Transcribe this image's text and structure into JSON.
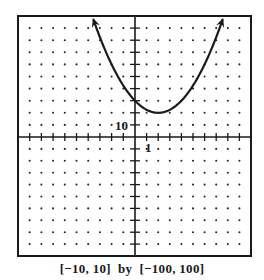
{
  "chart_data": {
    "type": "line",
    "title": "",
    "function": "y = 2.5(x - 2)^2 + 20",
    "xlim": [
      -10,
      10
    ],
    "ylim": [
      -100,
      100
    ],
    "xscl": 1,
    "yscl": 10,
    "grid": "dots",
    "x_tick_label": "1",
    "y_tick_label": "10",
    "caption": "[−10, 10] by [−100, 100]",
    "series": [
      {
        "name": "parabola",
        "x": [
          -3.54,
          -3,
          -2,
          -1,
          0,
          1,
          2,
          3,
          4,
          5,
          6,
          7,
          7.54
        ],
        "values": [
          96.7,
          82.5,
          60,
          42.5,
          30,
          22.5,
          20,
          22.5,
          30,
          42.5,
          60,
          82.5,
          96.7
        ],
        "arrows": "both ends",
        "vertex": [
          2,
          20
        ],
        "y_intercept": 30
      }
    ],
    "colors": {
      "line": "#1a1a1a",
      "frame": "#1a1a1a",
      "dots": "#2a2a2a",
      "background": "#ffffff"
    }
  },
  "labels": {
    "x_tick": "1",
    "y_tick": "10",
    "caption": "[−10, 10]  by  [−100, 100]"
  }
}
